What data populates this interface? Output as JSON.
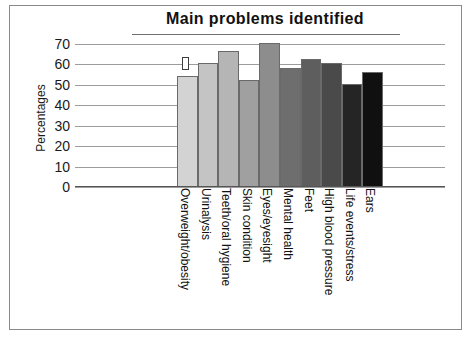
{
  "chart_data": {
    "type": "bar",
    "title": "Main problems identified",
    "xlabel": "",
    "ylabel": "Percentages",
    "ylim": [
      0,
      70
    ],
    "ytick_step": 10,
    "yticks": [
      "70",
      "60",
      "50",
      "40",
      "30",
      "20",
      "10",
      "0"
    ],
    "grid": true,
    "legend": "none",
    "categories": [
      "Overweight/obesity",
      "Urinalysis",
      "Teeth/oral hygiene",
      "Skin condition",
      "Eyes/eyesight",
      "Mental health",
      "Feet",
      "High blood pressure",
      "Life events/stress",
      "Ears"
    ],
    "values": [
      54,
      60,
      66,
      52,
      70,
      58,
      62,
      60,
      50,
      56
    ],
    "bar_colors": [
      "#d3d3d3",
      "#c4c4c4",
      "#b5b5b5",
      "#a0a0a0",
      "#8d8d8d",
      "#6e6e6e",
      "#5e5e5e",
      "#4a4a4a",
      "#252525",
      "#101010"
    ],
    "annotation_marker": {
      "label": "",
      "near_category": "Overweight/obesity",
      "value_top": 63,
      "value_bottom": 57
    }
  },
  "frame": {
    "border_color": "#8a8a8a",
    "background": "#ffffff"
  }
}
